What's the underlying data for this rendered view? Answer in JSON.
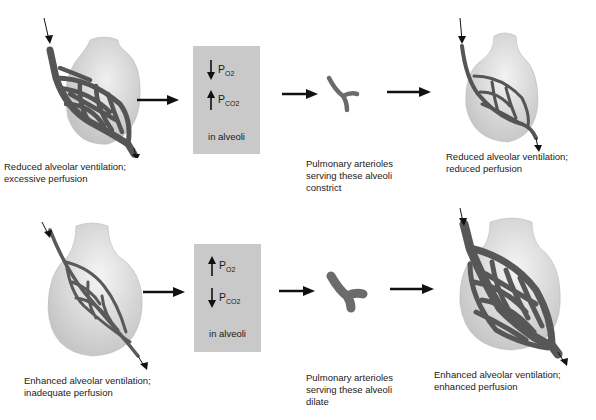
{
  "rows": [
    {
      "start_caption": "Reduced alveolar ventilation;\nexcessive perfusion",
      "box": {
        "line1": {
          "direction": "down",
          "label": "P",
          "sub": "O2"
        },
        "line2": {
          "direction": "up",
          "label": "P",
          "sub": "CO2"
        },
        "footer": "in alveoli"
      },
      "arteriole_caption": "Pulmonary arterioles\nserving these alveoli\nconstrict",
      "end_caption": "Reduced alveolar ventilation;\nreduced perfusion"
    },
    {
      "start_caption": "Enhanced alveolar ventilation;\ninadequate perfusion",
      "box": {
        "line1": {
          "direction": "up",
          "label": "P",
          "sub": "O2"
        },
        "line2": {
          "direction": "down",
          "label": "P",
          "sub": "CO2"
        },
        "footer": "in alveoli"
      },
      "arteriole_caption": "Pulmonary arterioles\nserving these alveoli\ndilate",
      "end_caption": "Enhanced alveolar ventilation;\nenhanced perfusion"
    }
  ],
  "colors": {
    "alveolus": "#d4d4d4",
    "capillary": "#585858",
    "box": "#c9c9c9",
    "arrow": "#111111"
  }
}
